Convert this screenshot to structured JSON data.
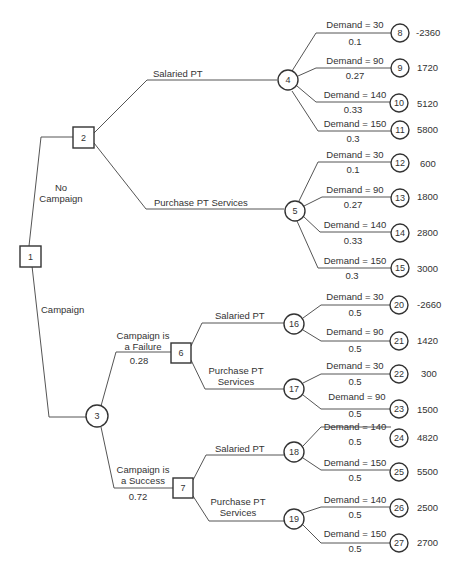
{
  "diagram": {
    "type": "decision-tree",
    "nodes": [
      {
        "id": "1",
        "kind": "decision",
        "x": 32,
        "y": 256
      },
      {
        "id": "2",
        "kind": "decision",
        "x": 83,
        "y": 138
      },
      {
        "id": "3",
        "kind": "chance",
        "x": 97,
        "y": 416
      },
      {
        "id": "4",
        "kind": "chance",
        "x": 288,
        "y": 81
      },
      {
        "id": "5",
        "kind": "chance",
        "x": 295,
        "y": 211
      },
      {
        "id": "6",
        "kind": "decision",
        "x": 181,
        "y": 353
      },
      {
        "id": "7",
        "kind": "decision",
        "x": 183,
        "y": 488
      },
      {
        "id": "16",
        "kind": "chance",
        "x": 295,
        "y": 324
      },
      {
        "id": "17",
        "kind": "chance",
        "x": 295,
        "y": 389
      },
      {
        "id": "18",
        "kind": "chance",
        "x": 295,
        "y": 452
      },
      {
        "id": "19",
        "kind": "chance",
        "x": 295,
        "y": 519
      },
      {
        "id": "8",
        "kind": "terminal",
        "x": 400,
        "y": 32,
        "payoff": "-2360"
      },
      {
        "id": "9",
        "kind": "terminal",
        "x": 400,
        "y": 68,
        "payoff": "1720"
      },
      {
        "id": "10",
        "kind": "terminal",
        "x": 400,
        "y": 104,
        "payoff": "5120"
      },
      {
        "id": "11",
        "kind": "terminal",
        "x": 400,
        "y": 130,
        "payoff": "5800"
      },
      {
        "id": "12",
        "kind": "terminal",
        "x": 400,
        "y": 164,
        "payoff": "600"
      },
      {
        "id": "13",
        "kind": "terminal",
        "x": 400,
        "y": 199,
        "payoff": "1800"
      },
      {
        "id": "14",
        "kind": "terminal",
        "x": 400,
        "y": 233,
        "payoff": "2800"
      },
      {
        "id": "15",
        "kind": "terminal",
        "x": 400,
        "y": 269,
        "payoff": "3000"
      },
      {
        "id": "20",
        "kind": "terminal",
        "x": 400,
        "y": 305,
        "payoff": "-2660"
      },
      {
        "id": "21",
        "kind": "terminal",
        "x": 400,
        "y": 341,
        "payoff": "1420"
      },
      {
        "id": "22",
        "kind": "terminal",
        "x": 400,
        "y": 374,
        "payoff": "300"
      },
      {
        "id": "23",
        "kind": "terminal",
        "x": 400,
        "y": 409,
        "payoff": "1500"
      },
      {
        "id": "24",
        "kind": "terminal",
        "x": 400,
        "y": 438,
        "payoff": "4820"
      },
      {
        "id": "25",
        "kind": "terminal",
        "x": 400,
        "y": 472,
        "payoff": "5500"
      },
      {
        "id": "26",
        "kind": "terminal",
        "x": 400,
        "y": 508,
        "payoff": "2500"
      },
      {
        "id": "27",
        "kind": "terminal",
        "x": 400,
        "y": 543,
        "payoff": "2700"
      }
    ],
    "branches": {
      "no_campaign": {
        "label_line1": "No",
        "label_line2": "Campaign"
      },
      "campaign": {
        "label": "Campaign"
      },
      "salaried_pt": {
        "label": "Salaried PT"
      },
      "purchase_pt_services": {
        "label": "Purchase PT Services"
      },
      "purchase_pt_line1": "Purchase PT",
      "purchase_pt_line2": "Services",
      "campaign_failure": {
        "line1": "Campaign is",
        "line2": "a Failure",
        "prob": "0.28"
      },
      "campaign_success": {
        "line1": "Campaign is",
        "line2": "a Success",
        "prob": "0.72"
      }
    },
    "demand_labels": {
      "d30": "Demand = 30",
      "d90": "Demand = 90",
      "d140": "Demand = 140",
      "d150": "Demand = 150"
    },
    "probabilities": {
      "p01": "0.1",
      "p027": "0.27",
      "p033": "0.33",
      "p03": "0.3",
      "p05": "0.5"
    },
    "node_labels": {
      "n1": "1",
      "n2": "2",
      "n3": "3",
      "n4": "4",
      "n5": "5",
      "n6": "6",
      "n7": "7",
      "n8": "8",
      "n9": "9",
      "n10": "10",
      "n11": "11",
      "n12": "12",
      "n13": "13",
      "n14": "14",
      "n15": "15",
      "n16": "16",
      "n17": "17",
      "n18": "18",
      "n19": "19",
      "n20": "20",
      "n21": "21",
      "n22": "22",
      "n23": "23",
      "n24": "24",
      "n25": "25",
      "n26": "26",
      "n27": "27"
    },
    "payoffs": {
      "p8": "-2360",
      "p9": "1720",
      "p10": "5120",
      "p11": "5800",
      "p12": "600",
      "p13": "1800",
      "p14": "2800",
      "p15": "3000",
      "p20": "-2660",
      "p21": "1420",
      "p22": "300",
      "p23": "1500",
      "p24": "4820",
      "p25": "5500",
      "p26": "2500",
      "p27": "2700"
    }
  }
}
